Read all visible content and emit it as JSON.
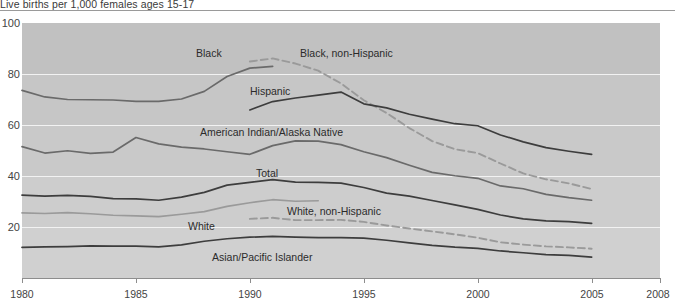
{
  "caption": "Live births per 1,000 females ages 15-17",
  "axes": {
    "y_ticks": [
      "100",
      "80",
      "60",
      "40",
      "20"
    ],
    "x_ticks": [
      "1980",
      "1985",
      "1990",
      "1995",
      "2000",
      "2005",
      "2008"
    ]
  },
  "annotations": {
    "black": "Black",
    "black_non_hispanic": "Black, non-Hispanic",
    "hispanic": "Hispanic",
    "american_indian": "American Indian/Alaska Native",
    "total": "Total",
    "white": "White",
    "white_non_hispanic": "White, non-Hispanic",
    "asian_pacific": "Asian/Pacific Islander"
  },
  "colors": {
    "plot_background": "#c9c9c9",
    "gridline": "#f2f2f2",
    "solid_line": "#4a4a4a",
    "dashed_line": "#9a9a9a",
    "axis": "#8d8d8d",
    "text": "#3a3a3a"
  },
  "chart_data": {
    "type": "line",
    "title": "Live births per 1,000 females ages 15-17",
    "xlabel": "",
    "ylabel": "Live births per 1,000 females ages 15-17",
    "xlim": [
      1980,
      2008
    ],
    "ylim": [
      0,
      100
    ],
    "ytick_values": [
      20,
      40,
      60,
      80,
      100
    ],
    "xtick_values": [
      1980,
      1985,
      1990,
      1995,
      2000,
      2005,
      2008
    ],
    "grid": "horizontal",
    "legend": "inline-annotations",
    "series": [
      {
        "name": "Black",
        "style": "solid",
        "color": "#6a6a6a",
        "x": [
          1980,
          1981,
          1982,
          1983,
          1984,
          1985,
          1986,
          1987,
          1988,
          1989,
          1990,
          1991
        ],
        "values": [
          73.6,
          71.0,
          70.0,
          69.9,
          69.8,
          69.3,
          69.3,
          70.2,
          73.2,
          79.0,
          82.3,
          83.0
        ]
      },
      {
        "name": "Black, non-Hispanic",
        "style": "dashed",
        "color": "#9a9a9a",
        "x": [
          1990,
          1991,
          1992,
          1993,
          1994,
          1995,
          1996,
          1997,
          1998,
          1999,
          2000,
          2001,
          2002,
          2003,
          2004,
          2005
        ],
        "values": [
          84.9,
          86.1,
          84.1,
          81.3,
          76.3,
          69.7,
          64.7,
          58.8,
          53.7,
          50.5,
          49.0,
          44.9,
          41.0,
          38.7,
          37.1,
          34.9
        ]
      },
      {
        "name": "Hispanic",
        "style": "solid",
        "color": "#3d3d3d",
        "x": [
          1990,
          1991,
          1992,
          1993,
          1994,
          1995,
          1996,
          1997,
          1998,
          1999,
          2000,
          2001,
          2002,
          2003,
          2004,
          2005
        ],
        "values": [
          65.9,
          69.2,
          70.6,
          71.7,
          72.9,
          68.3,
          66.7,
          64.2,
          62.3,
          60.5,
          59.7,
          56.1,
          53.4,
          51.1,
          49.7,
          48.5
        ]
      },
      {
        "name": "American Indian/Alaska Native",
        "style": "solid",
        "color": "#6a6a6a",
        "x": [
          1980,
          1981,
          1982,
          1983,
          1984,
          1985,
          1986,
          1987,
          1988,
          1989,
          1990,
          1991,
          1992,
          1993,
          1994,
          1995,
          1996,
          1997,
          1998,
          1999,
          2000,
          2001,
          2002,
          2003,
          2004,
          2005
        ],
        "values": [
          51.5,
          49.0,
          49.9,
          48.9,
          49.4,
          55.1,
          52.6,
          51.3,
          50.6,
          49.5,
          48.5,
          51.9,
          53.8,
          53.7,
          52.3,
          49.5,
          47.2,
          44.2,
          41.4,
          40.1,
          39.1,
          36.1,
          35.0,
          32.8,
          31.5,
          30.5
        ]
      },
      {
        "name": "Total",
        "style": "solid",
        "color": "#3d3d3d",
        "x": [
          1980,
          1981,
          1982,
          1983,
          1984,
          1985,
          1986,
          1987,
          1988,
          1989,
          1990,
          1991,
          1992,
          1993,
          1994,
          1995,
          1996,
          1997,
          1998,
          1999,
          2000,
          2001,
          2002,
          2003,
          2004,
          2005
        ],
        "values": [
          32.5,
          32.1,
          32.4,
          32.0,
          31.1,
          31.0,
          30.5,
          31.7,
          33.6,
          36.4,
          37.5,
          38.6,
          37.6,
          37.5,
          37.2,
          35.5,
          33.3,
          32.1,
          30.4,
          28.7,
          26.9,
          24.7,
          23.2,
          22.4,
          22.1,
          21.4
        ]
      },
      {
        "name": "White",
        "style": "solid",
        "color": "#9a9a9a",
        "x": [
          1980,
          1981,
          1982,
          1983,
          1984,
          1985,
          1986,
          1987,
          1988,
          1989,
          1990,
          1991,
          1992,
          1993
        ],
        "values": [
          25.5,
          25.3,
          25.6,
          25.2,
          24.6,
          24.4,
          24.1,
          25.0,
          26.0,
          28.1,
          29.5,
          30.7,
          30.1,
          30.3
        ]
      },
      {
        "name": "White, non-Hispanic",
        "style": "dashed",
        "color": "#9a9a9a",
        "x": [
          1990,
          1991,
          1992,
          1993,
          1994,
          1995,
          1996,
          1997,
          1998,
          1999,
          2000,
          2001,
          2002,
          2003,
          2004,
          2005
        ],
        "values": [
          23.2,
          23.6,
          22.7,
          22.7,
          22.8,
          22.0,
          20.6,
          19.4,
          18.3,
          17.1,
          15.8,
          14.0,
          13.1,
          12.4,
          12.0,
          11.5
        ]
      },
      {
        "name": "Asian/Pacific Islander",
        "style": "solid",
        "color": "#3d3d3d",
        "x": [
          1980,
          1981,
          1982,
          1983,
          1984,
          1985,
          1986,
          1987,
          1988,
          1989,
          1990,
          1991,
          1992,
          1993,
          1994,
          1995,
          1996,
          1997,
          1998,
          1999,
          2000,
          2001,
          2002,
          2003,
          2004,
          2005
        ],
        "values": [
          12.0,
          12.2,
          12.3,
          12.6,
          12.5,
          12.5,
          12.2,
          13.0,
          14.4,
          15.4,
          16.0,
          16.3,
          16.0,
          15.8,
          15.8,
          15.6,
          14.8,
          13.8,
          12.8,
          12.1,
          11.6,
          10.6,
          9.9,
          9.2,
          8.9,
          8.2
        ]
      }
    ]
  }
}
